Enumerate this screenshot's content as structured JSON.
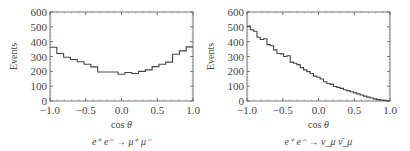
{
  "chart_data": [
    {
      "type": "bar",
      "subtype": "histogram-step",
      "title": "e+ e- → μ+ μ-",
      "xlabel": "cos θ",
      "ylabel": "Events",
      "xlim": [
        -1.0,
        1.0
      ],
      "ylim": [
        0,
        600
      ],
      "xticks": [
        "-1.0",
        "-0.5",
        "0.0",
        "0.5",
        "1.0"
      ],
      "yticks": [
        "0",
        "100",
        "200",
        "300",
        "400",
        "500",
        "600"
      ],
      "grid": false,
      "legend": null,
      "bin_edges_start": -1.0,
      "bin_width": 0.1,
      "values": [
        362,
        320,
        295,
        280,
        265,
        248,
        230,
        196,
        196,
        196,
        180,
        192,
        185,
        200,
        210,
        232,
        248,
        262,
        315,
        338,
        365
      ]
    },
    {
      "type": "bar",
      "subtype": "histogram-step",
      "title": "e+ e- → ν_μ ν̄_μ",
      "xlabel": "cos θ",
      "ylabel": "Events",
      "xlim": [
        -1.0,
        1.0
      ],
      "ylim": [
        0,
        600
      ],
      "xticks": [
        "-1.0",
        "-0.5",
        "0.0",
        "0.5",
        "1.0"
      ],
      "yticks": [
        "0",
        "100",
        "200",
        "300",
        "400",
        "500",
        "600"
      ],
      "grid": false,
      "legend": null,
      "bin_edges_start": -1.0,
      "bin_width": 0.05,
      "values": [
        505,
        480,
        470,
        430,
        415,
        420,
        380,
        372,
        345,
        320,
        318,
        300,
        305,
        262,
        255,
        245,
        225,
        210,
        198,
        185,
        168,
        160,
        148,
        130,
        118,
        112,
        98,
        92,
        85,
        76,
        70,
        62,
        55,
        48,
        40,
        33,
        26,
        20,
        14,
        9,
        6,
        4,
        2
      ]
    }
  ],
  "left": {
    "ylabel": "Events",
    "xlabel": "cos θ",
    "process_label": "e⁺ e⁻ → μ⁺ μ⁻"
  },
  "right": {
    "ylabel": "Events",
    "xlabel": "cos θ",
    "process_label": "e⁺ e⁻ → ν_μ ν̄_μ"
  }
}
